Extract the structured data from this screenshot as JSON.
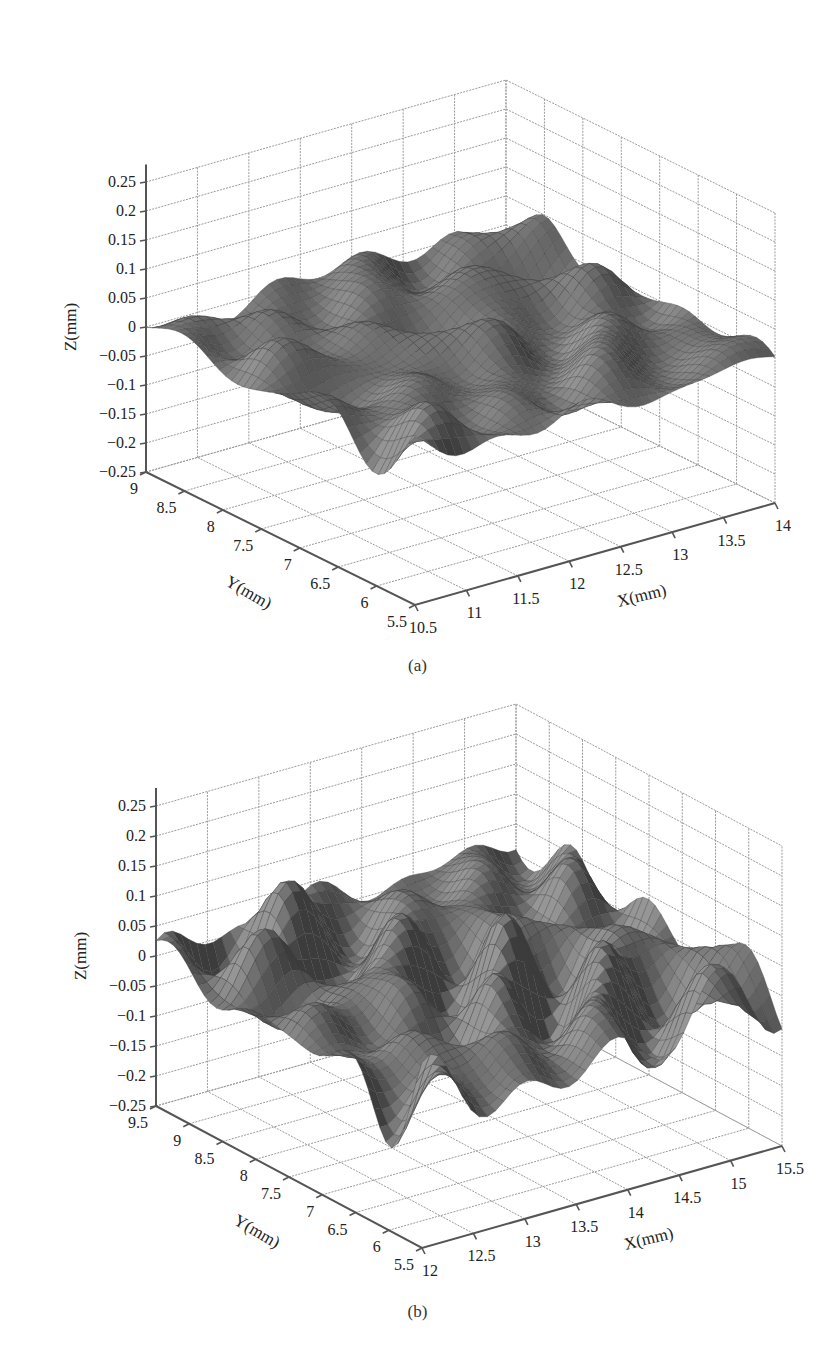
{
  "chart_data": [
    {
      "id": "a",
      "type": "surface3d",
      "caption": "(a)",
      "title": "",
      "xlabel": "X(mm)",
      "ylabel": "Y(mm)",
      "zlabel": "Z(mm)",
      "x_ticks": [
        "10.5",
        "11",
        "11.5",
        "12",
        "12.5",
        "13",
        "13.5",
        "14"
      ],
      "y_ticks": [
        "9",
        "8.5",
        "8",
        "7.5",
        "7",
        "6.5",
        "6",
        "5.5"
      ],
      "z_ticks": [
        "0.25",
        "0.2",
        "0.15",
        "0.1",
        "0.05",
        "0",
        "−0.05",
        "−0.1",
        "−0.15",
        "−0.2",
        "−0.25"
      ],
      "xlim": [
        10.5,
        14
      ],
      "ylim": [
        5.5,
        9
      ],
      "zlim": [
        -0.25,
        0.25
      ],
      "grid": true,
      "surface_color": "#6e6e6e",
      "description": "Rough surface height map, mostly within -0.1 to 0.1 mm, with peaks near 0.12 mm and troughs near -0.22 mm"
    },
    {
      "id": "b",
      "type": "surface3d",
      "caption": "(b)",
      "title": "",
      "xlabel": "X(mm)",
      "ylabel": "Y(mm)",
      "zlabel": "Z(mm)",
      "x_ticks": [
        "12",
        "12.5",
        "13",
        "13.5",
        "14",
        "14.5",
        "15",
        "15.5"
      ],
      "y_ticks": [
        "9.5",
        "9",
        "8.5",
        "8",
        "7.5",
        "7",
        "6.5",
        "6",
        "5.5"
      ],
      "z_ticks": [
        "0.25",
        "0.2",
        "0.15",
        "0.1",
        "0.05",
        "0",
        "−0.05",
        "−0.1",
        "−0.15",
        "−0.2",
        "−0.25"
      ],
      "xlim": [
        12,
        15.5
      ],
      "ylim": [
        5.5,
        9.5
      ],
      "zlim": [
        -0.25,
        0.25
      ],
      "grid": true,
      "surface_color": "#5c5c5c",
      "description": "Rough surface height map with pronounced peaks up to ~0.2 mm at the back and deep troughs to ~-0.25 mm at the front"
    }
  ]
}
